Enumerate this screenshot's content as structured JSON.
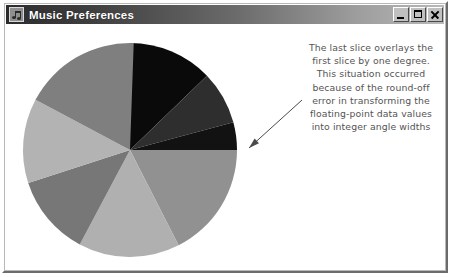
{
  "window": {
    "title": "Music Preferences",
    "icon": "music-note-icon",
    "controls": [
      {
        "name": "minimize-button",
        "label": "_"
      },
      {
        "name": "maximize-button",
        "label": "□"
      },
      {
        "name": "close-button",
        "label": "×"
      }
    ]
  },
  "annotation": {
    "lines": [
      "The last slice overlays the",
      "first slice by one degree.",
      "This situation occurred",
      "because of the round-off",
      "error in transforming the",
      "floating-point data values",
      "into integer angle widths"
    ],
    "color": "#545454",
    "pointer": {
      "name": "annotation-arrow",
      "from_x": 296,
      "from_y": 76,
      "to_x": 243,
      "to_y": 124,
      "color": "#4a4a4a"
    }
  },
  "chart_data": {
    "type": "pie",
    "title": "",
    "center_x": 124,
    "center_y": 126,
    "radius": 107,
    "start_angle_deg": -90,
    "direction": "clockwise",
    "legend": "none",
    "grid": false,
    "note": "The last slice overlaps the first slice by one degree due to round-off error when converting floating-point values to integer angle widths.",
    "categories": [
      "Slice 1",
      "Slice 2",
      "Slice 3",
      "Slice 4",
      "Slice 5",
      "Slice 6",
      "Slice 7",
      "Slice 8"
    ],
    "angles_deg": [
      46,
      29,
      15,
      63,
      55,
      44,
      46,
      63
    ],
    "values": [
      12.8,
      8.1,
      4.2,
      17.5,
      15.3,
      12.2,
      12.8,
      17.5
    ],
    "colors": [
      "#0a0a0a",
      "#2e2e2e",
      "#121212",
      "#919191",
      "#b0b0b0",
      "#777777",
      "#b3b3b3",
      "#7f7f7f"
    ],
    "overlap_slice_index": 7,
    "overlap_degrees": 1
  }
}
